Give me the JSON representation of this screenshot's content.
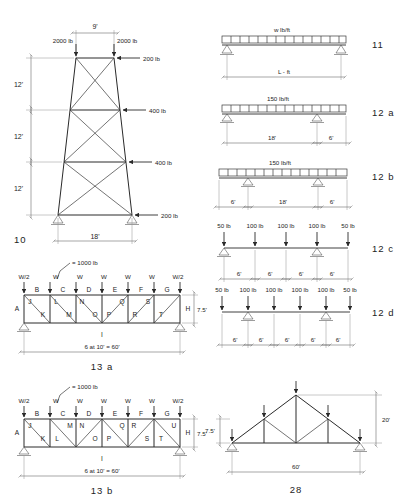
{
  "page": {
    "background": "#ffffff",
    "ink": "#1d1d1d"
  },
  "figures": [
    {
      "id": "fig-10",
      "number": "10",
      "type": "transmission-tower-truss",
      "top_width": "9'",
      "base_width": "18'",
      "panel_heights": [
        "12'",
        "12'",
        "12'"
      ],
      "vertical_loads": [
        "2000 lb",
        "2000 lb"
      ],
      "lateral_loads": [
        "200 lb",
        "400 lb",
        "400 lb",
        "200 lb"
      ]
    },
    {
      "id": "fig-11",
      "number": "11",
      "type": "simple-beam-udl",
      "load_label": "w lb/ft",
      "span_label": "L - ft"
    },
    {
      "id": "fig-12a",
      "number": "12 a",
      "type": "overhang-beam-udl",
      "load_label": "150 lb/ft",
      "dims": [
        "18'",
        "6'"
      ]
    },
    {
      "id": "fig-12b",
      "number": "12 b",
      "type": "double-overhang-beam-udl",
      "load_label": "150 lb/ft",
      "dims": [
        "6'",
        "18'",
        "6'"
      ]
    },
    {
      "id": "fig-12c",
      "number": "12 c",
      "type": "beam-point-loads",
      "loads": [
        "50 lb",
        "100 lb",
        "100 lb",
        "100 lb",
        "50 lb"
      ],
      "dims": [
        "6'",
        "6'",
        "6'",
        "6'"
      ]
    },
    {
      "id": "fig-12d",
      "number": "12 d",
      "type": "beam-point-loads",
      "loads": [
        "50 lb",
        "100 lb",
        "100 lb",
        "100 lb",
        "100 lb",
        "50 lb"
      ],
      "dims": [
        "6'",
        "6'",
        "6'",
        "6'",
        "6'"
      ]
    },
    {
      "id": "fig-13a",
      "number": "13 a",
      "type": "pratt-truss",
      "note": "= 1000 lb",
      "panel_loads": [
        "W/2",
        "W",
        "W",
        "W",
        "W",
        "W",
        "W/2"
      ],
      "top_chord_labels": [
        "B",
        "C",
        "D",
        "E",
        "F",
        "G"
      ],
      "end_labels": [
        "A",
        "H"
      ],
      "bottom_chord_label": "I",
      "web_labels": [
        "J",
        "K",
        "L",
        "M",
        "N",
        "O",
        "P",
        "Q",
        "R",
        "S",
        "T"
      ],
      "height": "7.5'",
      "span_label": "6 at 10' = 60'"
    },
    {
      "id": "fig-13b",
      "number": "13 b",
      "type": "warren-truss",
      "note": "= 1000 lb",
      "panel_loads": [
        "W/2",
        "W",
        "W",
        "W",
        "W",
        "W",
        "W/2"
      ],
      "top_chord_labels": [
        "B",
        "C",
        "D",
        "E",
        "F",
        "G"
      ],
      "end_labels": [
        "A",
        "H"
      ],
      "bottom_chord_label": "I",
      "web_labels": [
        "J",
        "K",
        "L",
        "M",
        "N",
        "O",
        "P",
        "Q",
        "R",
        "S",
        "T",
        "U"
      ],
      "height": "7.5'",
      "span_label": "6 at 10' = 60'"
    },
    {
      "id": "fig-28",
      "number": "28",
      "type": "fink-roof-truss",
      "rise": "20'",
      "half_rise": "7.5'",
      "span": "60'"
    }
  ]
}
